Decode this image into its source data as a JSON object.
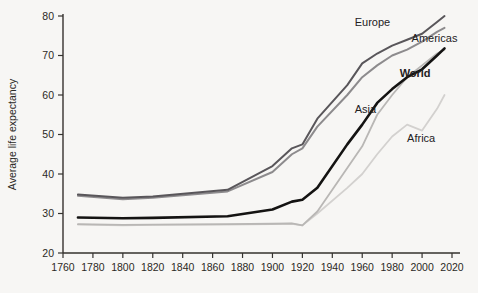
{
  "chart_data": {
    "type": "line",
    "title": "",
    "xlabel": "",
    "ylabel": "Average life expectancy",
    "xlim": [
      1760,
      2020
    ],
    "ylim": [
      20,
      80
    ],
    "grid": false,
    "legend_position": "inline-labels",
    "x_ticks": [
      1760,
      1780,
      1800,
      1820,
      1840,
      1860,
      1880,
      1900,
      1920,
      1940,
      1960,
      1980,
      2000,
      2020
    ],
    "y_ticks": [
      20,
      30,
      40,
      50,
      60,
      70,
      80
    ],
    "x": [
      1770,
      1800,
      1820,
      1870,
      1900,
      1913,
      1920,
      1930,
      1950,
      1960,
      1970,
      1980,
      1990,
      2000,
      2010,
      2015
    ],
    "series": [
      {
        "name": "Europe",
        "color": "#59565a",
        "width": 2.0,
        "label_x": 1955,
        "label_y": 77.5,
        "values": [
          34.8,
          34.0,
          34.3,
          36.0,
          42.0,
          46.5,
          47.5,
          54.0,
          62.5,
          68.0,
          70.5,
          72.5,
          74.0,
          75.5,
          78.5,
          80.0
        ]
      },
      {
        "name": "Americas",
        "color": "#8d8b8d",
        "width": 2.0,
        "label_x": 1993,
        "label_y": 73.5,
        "values": [
          34.5,
          33.6,
          34.0,
          35.6,
          40.5,
          45.0,
          46.5,
          52.0,
          60.0,
          64.5,
          67.5,
          70.0,
          71.5,
          73.5,
          76.0,
          77.0
        ]
      },
      {
        "name": "World",
        "color": "#141312",
        "width": 2.6,
        "label_x": 1985,
        "label_y": 64.5,
        "values": [
          29.0,
          28.8,
          28.9,
          29.3,
          31.0,
          33.0,
          33.5,
          36.5,
          47.5,
          52.5,
          58.0,
          61.5,
          64.5,
          66.5,
          70.0,
          71.8
        ]
      },
      {
        "name": "Asia",
        "color": "#b9b7b5",
        "width": 1.8,
        "label_x": 1955,
        "label_y": 55.5,
        "values": [
          27.3,
          27.1,
          27.2,
          27.3,
          27.4,
          27.5,
          27.0,
          30.5,
          41.5,
          47.0,
          55.0,
          60.0,
          64.5,
          67.5,
          70.5,
          71.5
        ]
      },
      {
        "name": "Africa",
        "color": "#d3d1cf",
        "width": 1.8,
        "label_x": 1990,
        "label_y": 48.0,
        "values": [
          27.2,
          27.0,
          27.1,
          27.2,
          27.3,
          27.4,
          27.0,
          30.0,
          36.5,
          40.0,
          45.0,
          49.5,
          52.5,
          51.0,
          56.5,
          60.0
        ]
      }
    ]
  }
}
